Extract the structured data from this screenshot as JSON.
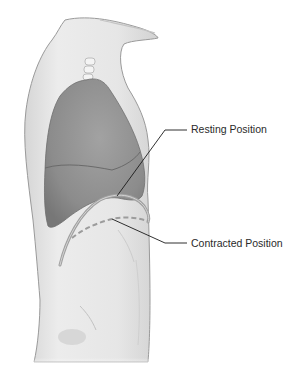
{
  "diagram": {
    "labels": [
      {
        "id": "resting",
        "text": "Resting Position"
      },
      {
        "id": "contracted",
        "text": "Contracted Position"
      }
    ],
    "colors": {
      "background": "#ffffff",
      "skin_fill": "#e9e9e9",
      "skin_outline": "#8a8a8a",
      "lung_fill": "#8f8f8f",
      "lung_lower_lobe": "#858585",
      "diaphragm_resting": "#a6a6a6",
      "diaphragm_contracted": "#9c9c9c",
      "leader_line": "#1a1a1a",
      "label_text": "#2a2a2a"
    }
  }
}
